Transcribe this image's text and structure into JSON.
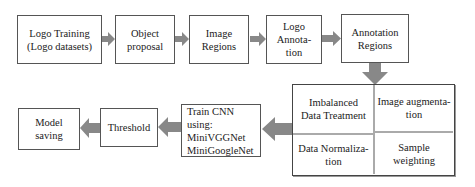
{
  "diagram": {
    "arrow_color": "#888888",
    "border_color": "#555555",
    "top_row": [
      {
        "id": "logo-training",
        "label": "Logo Training\n(Logo datasets)"
      },
      {
        "id": "object-proposal",
        "label": "Object\nproposal"
      },
      {
        "id": "image-regions",
        "label": "Image\nRegions"
      },
      {
        "id": "logo-annotation",
        "label": "Logo\nAnnota-\ntion"
      },
      {
        "id": "annotation-regions",
        "label": "Annotation\nRegions"
      }
    ],
    "preprocessing_grid": [
      {
        "id": "imbalanced-data-treatment",
        "label": "Imbalanced\nData Treatment"
      },
      {
        "id": "image-augmentation",
        "label": "Image augmenta-\ntion"
      },
      {
        "id": "data-normalization",
        "label": "Data Normaliza-\ntion"
      },
      {
        "id": "sample-weighting",
        "label": "Sample\nweighting"
      }
    ],
    "bottom_row": [
      {
        "id": "train-cnn",
        "label": "Train CNN\nusing:\nMiniVGGNet\nMiniGoogleNet"
      },
      {
        "id": "threshold",
        "label": "Threshold"
      },
      {
        "id": "model-saving",
        "label": "Model\nsaving"
      }
    ]
  }
}
